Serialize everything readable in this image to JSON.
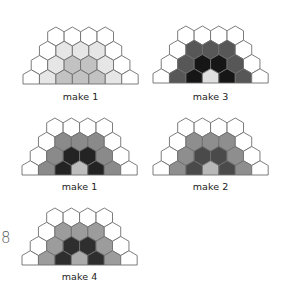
{
  "page_number": "8",
  "palette": {
    "W": "#ffffff",
    "stroke": "#6e6e6e"
  },
  "figures": [
    {
      "label": "make 1",
      "x": 23,
      "y": 27,
      "label_y": 91,
      "colors": {
        "L": "#e6e6e6",
        "M": "#c2c2c2",
        "D": "#adadad",
        "C": "#c2c2c2"
      },
      "rows": [
        [
          "W",
          "W",
          "W",
          "W"
        ],
        [
          "W",
          "L",
          "L",
          "L",
          "W"
        ],
        [
          "W",
          "L",
          "M",
          "M",
          "L",
          "W"
        ],
        [
          "W",
          "L",
          "M",
          "M",
          "M",
          "L",
          "W"
        ]
      ]
    },
    {
      "label": "make 3",
      "x": 153,
      "y": 26,
      "label_y": 91,
      "colors": {
        "L": "#ffffff",
        "M": "#575757",
        "D": "#161616",
        "C": "#e0e0e0"
      },
      "rows": [
        [
          "W",
          "W",
          "W",
          "W"
        ],
        [
          "W",
          "M",
          "M",
          "M",
          "W"
        ],
        [
          "W",
          "M",
          "D",
          "D",
          "M",
          "W"
        ],
        [
          "W",
          "M",
          "D",
          "C",
          "D",
          "M",
          "W"
        ]
      ]
    },
    {
      "label": "make 1",
      "x": 22,
      "y": 118,
      "label_y": 181,
      "colors": {
        "L": "#ffffff",
        "M": "#8a8a8a",
        "D": "#232323",
        "C": "#bdbdbd"
      },
      "rows": [
        [
          "W",
          "W",
          "W",
          "W"
        ],
        [
          "W",
          "M",
          "M",
          "M",
          "W"
        ],
        [
          "W",
          "M",
          "D",
          "D",
          "M",
          "W"
        ],
        [
          "W",
          "M",
          "D",
          "C",
          "D",
          "M",
          "W"
        ]
      ]
    },
    {
      "label": "make 2",
      "x": 153,
      "y": 118,
      "label_y": 181,
      "colors": {
        "L": "#ffffff",
        "M": "#8e8e8e",
        "D": "#4a4a4a",
        "C": "#b8b8b8"
      },
      "rows": [
        [
          "W",
          "W",
          "W",
          "W"
        ],
        [
          "W",
          "M",
          "M",
          "M",
          "W"
        ],
        [
          "W",
          "M",
          "D",
          "D",
          "M",
          "W"
        ],
        [
          "W",
          "M",
          "D",
          "C",
          "D",
          "M",
          "W"
        ]
      ]
    },
    {
      "label": "make 4",
      "x": 22,
      "y": 208,
      "label_y": 271,
      "colors": {
        "L": "#ffffff",
        "M": "#9c9c9c",
        "D": "#2e2e2e",
        "C": "#ababab"
      },
      "rows": [
        [
          "W",
          "W",
          "W",
          "W"
        ],
        [
          "W",
          "M",
          "M",
          "M",
          "W"
        ],
        [
          "W",
          "M",
          "D",
          "D",
          "M",
          "W"
        ],
        [
          "W",
          "M",
          "D",
          "C",
          "D",
          "M",
          "W"
        ]
      ]
    }
  ]
}
